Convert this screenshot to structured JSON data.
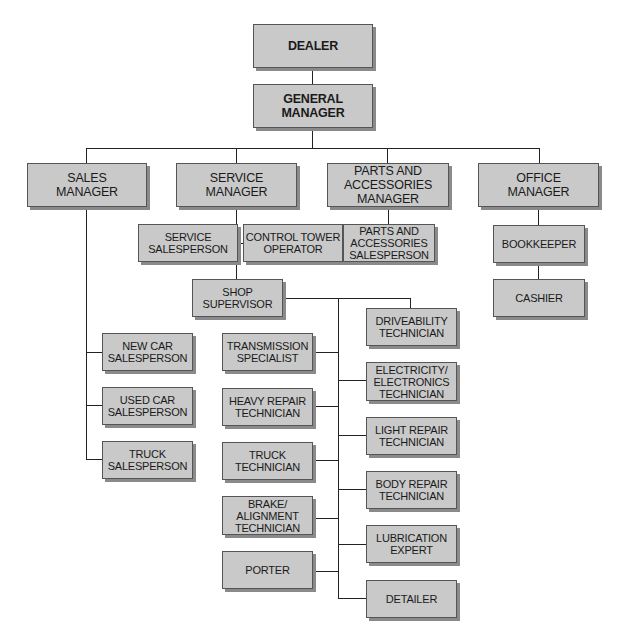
{
  "diagram": {
    "type": "org-chart",
    "colors": {
      "box_fill": "#c9c9c9",
      "box_border": "#555555",
      "shadow": "#8a8a8a",
      "line": "#222222"
    },
    "nodes": {
      "dealer": "DEALER",
      "general_manager": "GENERAL\nMANAGER",
      "sales_manager": "SALES\nMANAGER",
      "service_manager": "SERVICE\nMANAGER",
      "parts_manager": "PARTS AND\nACCESSORIES\nMANAGER",
      "office_manager": "OFFICE\nMANAGER",
      "service_salesperson": "SERVICE\nSALESPERSON",
      "control_tower": "CONTROL TOWER\nOPERATOR",
      "parts_salesperson": "PARTS AND\nACCESSORIES\nSALESPERSON",
      "bookkeeper": "BOOKKEEPER",
      "cashier": "CASHIER",
      "shop_supervisor": "SHOP\nSUPERVISOR",
      "new_car": "NEW CAR\nSALESPERSON",
      "used_car": "USED CAR\nSALESPERSON",
      "truck_sales": "TRUCK\nSALESPERSON",
      "transmission": "TRANSMISSION\nSPECIALIST",
      "heavy_repair": "HEAVY REPAIR\nTECHNICIAN",
      "truck_tech": "TRUCK\nTECHNICIAN",
      "brake": "BRAKE/\nALIGNMENT\nTECHNICIAN",
      "porter": "PORTER",
      "driveability": "DRIVEABILITY\nTECHNICIAN",
      "electricity": "ELECTRICITY/\nELECTRONICS\nTECHNICIAN",
      "light_repair": "LIGHT REPAIR\nTECHNICIAN",
      "body_repair": "BODY REPAIR\nTECHNICIAN",
      "lubrication": "LUBRICATION\nEXPERT",
      "detailer": "DETAILER"
    },
    "edges": [
      [
        "dealer",
        "general_manager"
      ],
      [
        "general_manager",
        "sales_manager"
      ],
      [
        "general_manager",
        "service_manager"
      ],
      [
        "general_manager",
        "parts_manager"
      ],
      [
        "general_manager",
        "office_manager"
      ],
      [
        "service_manager",
        "service_salesperson"
      ],
      [
        "service_manager",
        "control_tower"
      ],
      [
        "service_manager",
        "shop_supervisor"
      ],
      [
        "parts_manager",
        "parts_salesperson"
      ],
      [
        "office_manager",
        "bookkeeper"
      ],
      [
        "bookkeeper",
        "cashier"
      ],
      [
        "sales_manager",
        "new_car"
      ],
      [
        "sales_manager",
        "used_car"
      ],
      [
        "sales_manager",
        "truck_sales"
      ],
      [
        "shop_supervisor",
        "transmission"
      ],
      [
        "shop_supervisor",
        "heavy_repair"
      ],
      [
        "shop_supervisor",
        "truck_tech"
      ],
      [
        "shop_supervisor",
        "brake"
      ],
      [
        "shop_supervisor",
        "porter"
      ],
      [
        "shop_supervisor",
        "driveability"
      ],
      [
        "shop_supervisor",
        "electricity"
      ],
      [
        "shop_supervisor",
        "light_repair"
      ],
      [
        "shop_supervisor",
        "body_repair"
      ],
      [
        "shop_supervisor",
        "lubrication"
      ],
      [
        "shop_supervisor",
        "detailer"
      ]
    ]
  }
}
